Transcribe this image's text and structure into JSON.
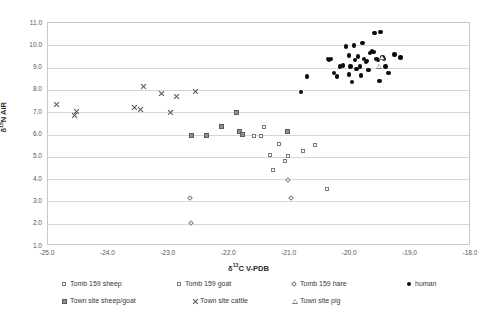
{
  "chart_data": {
    "type": "scatter",
    "title": "",
    "xlabel": "δ¹³C V-PDB",
    "ylabel": "δ¹⁵N AIR",
    "xlim": [
      -25.0,
      -18.0
    ],
    "ylim": [
      1.0,
      11.0
    ],
    "xticks": [
      "-25.0",
      "-24.0",
      "-23.0",
      "-22.0",
      "-21.0",
      "-20.0",
      "-19.0",
      "-18.0"
    ],
    "yticks": [
      "1.0",
      "2.0",
      "3.0",
      "4.0",
      "5.0",
      "6.0",
      "7.0",
      "8.0",
      "9.0",
      "10.0",
      "11.0"
    ],
    "grid": "horizontal",
    "legend_position": "bottom",
    "series": [
      {
        "name": "Tomb 159 sheep",
        "marker": "open-square",
        "color": "#7a7a7a",
        "points": [
          [
            -21.3,
            5.0
          ],
          [
            -21.25,
            4.3
          ],
          [
            -21.15,
            5.5
          ],
          [
            -21.05,
            4.7
          ],
          [
            -21.0,
            4.95
          ],
          [
            -20.75,
            5.15
          ],
          [
            -20.55,
            5.45
          ],
          [
            -20.35,
            3.45
          ]
        ]
      },
      {
        "name": "Tomb 159 goat",
        "marker": "open-square",
        "color": "#7a7a7a",
        "points": [
          [
            -21.55,
            5.85
          ],
          [
            -21.45,
            5.85
          ],
          [
            -21.4,
            6.25
          ]
        ]
      },
      {
        "name": "Tomb 159 hare",
        "marker": "open-diamond",
        "color": "#7a7a7a",
        "points": [
          [
            -22.62,
            3.05
          ],
          [
            -22.6,
            1.95
          ],
          [
            -21.0,
            3.85
          ],
          [
            -20.95,
            3.05
          ]
        ]
      },
      {
        "name": "human",
        "marker": "filled-circle",
        "color": "#0b0b0b",
        "points": [
          [
            -20.8,
            7.85
          ],
          [
            -20.7,
            8.55
          ],
          [
            -20.35,
            9.35
          ],
          [
            -20.33,
            9.3
          ],
          [
            -20.3,
            9.35
          ],
          [
            -20.25,
            8.7
          ],
          [
            -20.2,
            8.55
          ],
          [
            -20.15,
            9.0
          ],
          [
            -20.1,
            9.05
          ],
          [
            -20.05,
            9.9
          ],
          [
            -20.0,
            9.5
          ],
          [
            -20.0,
            8.65
          ],
          [
            -19.98,
            9.0
          ],
          [
            -19.95,
            8.3
          ],
          [
            -19.92,
            9.95
          ],
          [
            -19.9,
            9.3
          ],
          [
            -19.88,
            8.9
          ],
          [
            -19.85,
            9.45
          ],
          [
            -19.82,
            9.0
          ],
          [
            -19.8,
            8.6
          ],
          [
            -19.78,
            10.05
          ],
          [
            -19.75,
            9.35
          ],
          [
            -19.72,
            9.2
          ],
          [
            -19.7,
            9.25
          ],
          [
            -19.68,
            8.85
          ],
          [
            -19.65,
            9.6
          ],
          [
            -19.62,
            9.7
          ],
          [
            -19.6,
            9.65
          ],
          [
            -19.58,
            10.5
          ],
          [
            -19.55,
            9.35
          ],
          [
            -19.52,
            9.3
          ],
          [
            -19.5,
            8.35
          ],
          [
            -19.48,
            10.55
          ],
          [
            -19.45,
            9.4
          ],
          [
            -19.42,
            9.35
          ],
          [
            -19.4,
            9.0
          ],
          [
            -19.35,
            8.7
          ],
          [
            -19.25,
            9.55
          ],
          [
            -19.15,
            9.4
          ]
        ]
      },
      {
        "name": "Town site sheep/goat",
        "marker": "filled-square",
        "color": "#8e8e96",
        "points": [
          [
            -22.6,
            5.85
          ],
          [
            -22.35,
            5.85
          ],
          [
            -22.1,
            6.25
          ],
          [
            -21.85,
            6.9
          ],
          [
            -21.8,
            6.05
          ],
          [
            -21.75,
            5.9
          ],
          [
            -21.0,
            6.05
          ]
        ]
      },
      {
        "name": "Town site cattle",
        "marker": "cross",
        "color": "#555555",
        "points": [
          [
            -24.85,
            7.3
          ],
          [
            -24.55,
            6.8
          ],
          [
            -24.52,
            6.95
          ],
          [
            -23.55,
            7.15
          ],
          [
            -23.45,
            7.05
          ],
          [
            -23.4,
            8.1
          ],
          [
            -23.1,
            7.75
          ],
          [
            -22.85,
            7.65
          ],
          [
            -22.95,
            6.9
          ],
          [
            -22.55,
            7.85
          ]
        ]
      },
      {
        "name": "Town site pig",
        "marker": "open-triangle",
        "color": "#777777",
        "points": [
          [
            -19.45,
            9.4
          ],
          [
            -19.5,
            9.0
          ]
        ]
      }
    ]
  },
  "legend": {
    "rows": [
      [
        {
          "marker": "open-square",
          "label": "Tomb 159 sheep"
        },
        {
          "marker": "open-square",
          "label": "Tomb 159 goat"
        },
        {
          "marker": "open-diamond",
          "label": "Tomb 159 hare"
        },
        {
          "marker": "filled-circle",
          "label": "human"
        }
      ],
      [
        {
          "marker": "filled-square",
          "label": "Town site sheep/goat"
        },
        {
          "marker": "cross",
          "label": "Town site cattle"
        },
        {
          "marker": "open-triangle",
          "label": "Town site pig"
        }
      ]
    ]
  }
}
